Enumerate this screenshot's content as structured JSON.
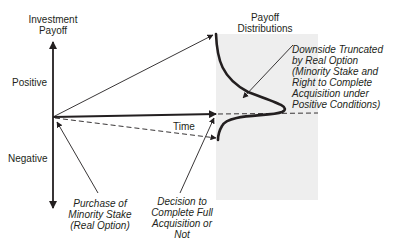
{
  "axes": {
    "y_axis_title_line1": "Investment",
    "y_axis_title_line2": "Payoff",
    "positive_label": "Positive",
    "negative_label": "Negative",
    "x_axis_label": "Time"
  },
  "distributions": {
    "title_line1": "Payoff",
    "title_line2": "Distributions",
    "box_color": "#eeeeee"
  },
  "annotations": {
    "downside": [
      "Downside Truncated",
      "by Real Option",
      "(Minority Stake and",
      "Right to Complete",
      "Acquisition under",
      "Positive Conditions)"
    ],
    "purchase": [
      "Purchase of",
      "Minority Stake",
      "(Real Option)"
    ],
    "decision": [
      "Decision to",
      "Complete Full",
      "Acquisition or",
      "Not"
    ]
  },
  "colors": {
    "ink": "#231f20",
    "background": "#ffffff"
  }
}
